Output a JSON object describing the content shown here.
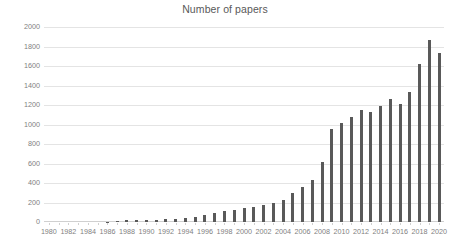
{
  "chart_data": {
    "type": "bar",
    "title": "Number of papers",
    "xlabel": "",
    "ylabel": "",
    "ylim": [
      0,
      2000
    ],
    "ytick_step": 200,
    "yticks": [
      0,
      200,
      400,
      600,
      800,
      1000,
      1200,
      1400,
      1600,
      1800,
      2000
    ],
    "ytick_labels": [
      "0",
      "200",
      "400",
      "600",
      "800",
      "1000",
      "1200",
      "1400",
      "1600",
      "1800",
      "2000"
    ],
    "xtick_labels": [
      "1980",
      "1982",
      "1984",
      "1986",
      "1988",
      "1990",
      "1992",
      "1994",
      "1996",
      "1998",
      "2000",
      "2002",
      "2004",
      "2006",
      "2008",
      "2010",
      "2012",
      "2014",
      "2016",
      "2018",
      "2020"
    ],
    "xtick_interval": 2,
    "grid": true,
    "legend": false,
    "bar_color": "#595959",
    "grid_color": "#e4e4e4",
    "axis_color": "#d0d0d0",
    "text_color": "#7f7f7f",
    "title_color": "#595959",
    "categories": [
      1980,
      1981,
      1982,
      1983,
      1984,
      1985,
      1986,
      1987,
      1988,
      1989,
      1990,
      1991,
      1992,
      1993,
      1994,
      1995,
      1996,
      1997,
      1998,
      1999,
      2000,
      2001,
      2002,
      2003,
      2004,
      2005,
      2006,
      2007,
      2008,
      2009,
      2010,
      2011,
      2012,
      2013,
      2014,
      2015,
      2016,
      2017,
      2018,
      2019,
      2020
    ],
    "values": [
      0,
      0,
      0,
      0,
      0,
      0,
      5,
      12,
      20,
      18,
      22,
      25,
      28,
      30,
      45,
      55,
      75,
      95,
      110,
      120,
      140,
      150,
      175,
      195,
      230,
      300,
      360,
      430,
      620,
      950,
      1020,
      1080,
      1150,
      1130,
      1190,
      1260,
      1210,
      1330,
      1620,
      1870,
      1730
    ]
  }
}
